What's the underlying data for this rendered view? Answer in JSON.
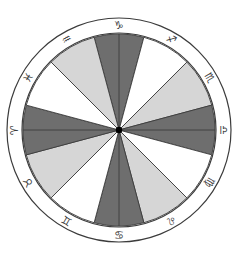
{
  "figure": {
    "name": "zodiac-wheel",
    "background_color": "#ffffff",
    "center": {
      "x": 119,
      "y": 130
    },
    "radii": {
      "outer_ring_outer": 112,
      "outer_ring_inner": 97,
      "pie_radius": 96,
      "glyph_ring": 104.5,
      "center_dot": 3.2
    },
    "stroke": {
      "color": "#3c3c3c",
      "ring_width": 1.2,
      "sector_width": 0.9
    }
  },
  "palette": {
    "white": "#ffffff",
    "light_gray": "#d6d6d6",
    "dark_gray": "#6e6e6e",
    "outline": "#3c3c3c",
    "glyph": "#3a3a3a",
    "center_dot": "#000000"
  },
  "chart_data": {
    "type": "pie",
    "subtitle": "",
    "xlabel": "",
    "ylabel": "",
    "grid": false,
    "legend_position": "none",
    "slice_count": 12,
    "slice_degrees": 30,
    "start_angle_top": 0,
    "direction": "clockwise",
    "categories": [
      "Capricorn",
      "Sagittarius",
      "Scorpio",
      "Libra",
      "Virgo",
      "Leo",
      "Cancer",
      "Gemini",
      "Taurus",
      "Aries",
      "Pisces",
      "Aquarius"
    ],
    "values": [
      30,
      30,
      30,
      30,
      30,
      30,
      30,
      30,
      30,
      30,
      30,
      30
    ],
    "fills": [
      "dark_gray",
      "white",
      "light_gray",
      "dark_gray",
      "white",
      "light_gray",
      "dark_gray",
      "white",
      "light_gray",
      "dark_gray",
      "white",
      "light_gray"
    ],
    "annotations": [
      "horizontal diameter line across wheel",
      "vertical diameter line across wheel",
      "black dot marking wheel center"
    ]
  },
  "signs": [
    {
      "name": "Capricorn",
      "glyph": "♑",
      "label": "capricorn",
      "position": "top",
      "angle_deg": 0,
      "sector_fill": "dark_gray",
      "sector_start": 345,
      "sector_end": 15
    },
    {
      "name": "Sagittarius",
      "glyph": "♐",
      "label": "sagittarius",
      "position": "top-right",
      "angle_deg": 30,
      "sector_fill": "white",
      "sector_start": 15,
      "sector_end": 45
    },
    {
      "name": "Scorpio",
      "glyph": "♏",
      "label": "scorpio",
      "position": "upper-right",
      "angle_deg": 60,
      "sector_fill": "light_gray",
      "sector_start": 45,
      "sector_end": 75
    },
    {
      "name": "Libra",
      "glyph": "♎",
      "label": "libra",
      "position": "right",
      "angle_deg": 90,
      "sector_fill": "dark_gray",
      "sector_start": 75,
      "sector_end": 105
    },
    {
      "name": "Virgo",
      "glyph": "♍",
      "label": "virgo",
      "position": "lower-right",
      "angle_deg": 120,
      "sector_fill": "white",
      "sector_start": 105,
      "sector_end": 135
    },
    {
      "name": "Leo",
      "glyph": "♌",
      "label": "leo",
      "position": "bottom-right",
      "angle_deg": 150,
      "sector_fill": "light_gray",
      "sector_start": 135,
      "sector_end": 165
    },
    {
      "name": "Cancer",
      "glyph": "♋",
      "label": "cancer",
      "position": "bottom",
      "angle_deg": 180,
      "sector_fill": "dark_gray",
      "sector_start": 165,
      "sector_end": 195
    },
    {
      "name": "Gemini",
      "glyph": "♊",
      "label": "gemini",
      "position": "bottom-left",
      "angle_deg": 210,
      "sector_fill": "white",
      "sector_start": 195,
      "sector_end": 225
    },
    {
      "name": "Taurus",
      "glyph": "♉",
      "label": "taurus",
      "position": "lower-left",
      "angle_deg": 240,
      "sector_fill": "light_gray",
      "sector_start": 225,
      "sector_end": 255
    },
    {
      "name": "Aries",
      "glyph": "♈",
      "label": "aries",
      "position": "left",
      "angle_deg": 270,
      "sector_fill": "dark_gray",
      "sector_start": 255,
      "sector_end": 285
    },
    {
      "name": "Pisces",
      "glyph": "♓",
      "label": "pisces",
      "position": "upper-left",
      "angle_deg": 300,
      "sector_fill": "white",
      "sector_start": 285,
      "sector_end": 315
    },
    {
      "name": "Aquarius",
      "glyph": "♒",
      "label": "aquarius",
      "position": "top-left",
      "angle_deg": 330,
      "sector_fill": "light_gray",
      "sector_start": 315,
      "sector_end": 345
    }
  ]
}
